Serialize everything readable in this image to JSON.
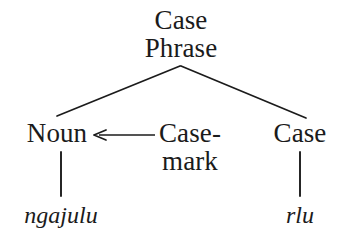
{
  "diagram": {
    "type": "syntax-tree",
    "background_color": "#ffffff",
    "ink_color": "#1b1b1b",
    "root": {
      "label": "Case\nPhrase",
      "line1": "Case",
      "line2": "Phrase"
    },
    "nodes": [
      {
        "id": "noun",
        "label": "Noun"
      },
      {
        "id": "case-mark",
        "label": "Case-\nmark",
        "line1": "Case-",
        "line2": "mark"
      },
      {
        "id": "case",
        "label": "Case"
      }
    ],
    "terminals": [
      {
        "id": "ngajulu",
        "label": "ngajulu",
        "parent": "noun",
        "style": "italic"
      },
      {
        "id": "rlu",
        "label": "rlu",
        "parent": "case",
        "style": "italic"
      }
    ],
    "arrow": {
      "direction": "left",
      "from": "case-mark",
      "to": "noun"
    }
  }
}
